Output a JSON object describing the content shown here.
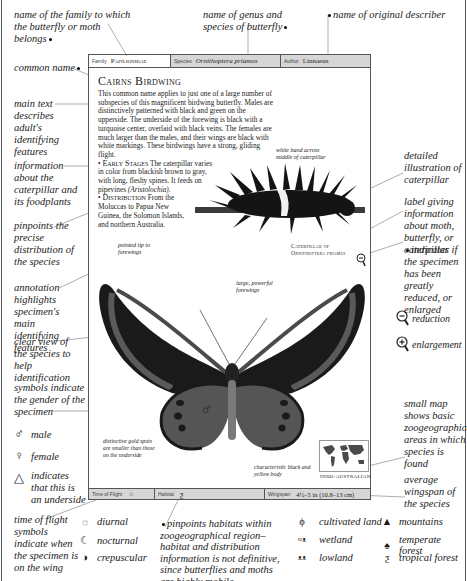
{
  "header": {
    "family_label": "Family",
    "family_value": "Papilionidae",
    "species_label": "Species",
    "species_value": "Ornithoptera priamus",
    "author_label": "Author",
    "author_value": "Linnaeus"
  },
  "main": {
    "title": "Cairns Birdwing",
    "body": "This common name applies to just one of a large number of subspecies of this magnificent birdwing butterfly. Males are distinctively patterned with black and green on the upperside. The underside of the forewing is black with a turquoise center, overlaid with black veins. The females are much larger than the males, and their wings are black with white markings. These birdwings have a strong, gliding flight.",
    "early_stages_label": "Early Stages",
    "early_stages_text": "The caterpillar varies in color from blackish brown to gray, with long, fleshy spines. It feeds on pipevines",
    "early_stages_plant": "(Aristolochia).",
    "distribution_label": "Distribution",
    "distribution_text": "From the Moluccas to Papua New Guinea, the Solomon Islands, and northern Australia.",
    "caterpillar_caption_line1": "Caterpillar of",
    "caterpillar_caption_line2": "Ornithoptera priamus",
    "gender_symbol": "♂",
    "map_label": "Indo-Australian"
  },
  "inner_annotations": {
    "white_band": "white band across middle of caterpillar",
    "pointed_tip": "pointed tip to forewings",
    "large_forewings": "large, powerful forewings",
    "gold_spots": "distinctive gold spots are smaller than those on the underside",
    "black_yellow_body": "characteristic black and yellow body"
  },
  "footer": {
    "time_label": "Time of Flight",
    "time_icon": "sun-icon",
    "habitat_label": "Habitat",
    "habitat_icon": "tropical-forest-icon",
    "wingspan_label": "Wingspan",
    "wingspan_value": "4½–5 in (10.8–13 cm)"
  },
  "top_annotations": {
    "family": "name of the family to which the butterfly or moth belongs",
    "genus_species": "name of genus and species of butterfly",
    "describer": "name of original describer"
  },
  "left_annotations": {
    "common_name": "common name",
    "main_text": "main text describes adult's identifying features",
    "caterpillar_info": "information about the caterpillar and its foodplants",
    "distribution": "pinpoints the precise distribution of the species",
    "annotation": "annotation highlights specimen's main identifying features",
    "clear_view": "clear view of the species to help identification",
    "gender": "symbols indicate the gender of the specimen"
  },
  "right_annotations": {
    "detailed_illustration": "detailed illustration of caterpillar",
    "label_info": "label giving information about moth, butterfly, or caterpillar",
    "scale_indicator": "indicates if the specimen has been greatly reduced, or enlarged",
    "reduction": "reduction",
    "enlargement": "enlargement",
    "small_map": "small map shows basic zoogeographical areas in which species is found",
    "wingspan": "average wingspan of the species"
  },
  "symbol_legend": {
    "male": "male",
    "female": "female",
    "underside": "indicates that this is an underside"
  },
  "bottom_annotations": {
    "time_of_flight": "time of flight symbols indicate when the specimen is on the wing",
    "habitat": "pinpoints habitats within zoogeographical region–habitat and distribution information is not definitive, since butterflies and moths are highly mobile"
  },
  "flight_legend": [
    {
      "icon": "sun-icon",
      "label": "diurnal"
    },
    {
      "icon": "moon-icon",
      "label": "nocturnal"
    },
    {
      "icon": "half-circle-icon",
      "label": "crepuscular"
    }
  ],
  "habitat_legend": [
    {
      "icon": "cultivated-land-icon",
      "label": "cultivated land"
    },
    {
      "icon": "wetland-icon",
      "label": "wetland"
    },
    {
      "icon": "lowland-icon",
      "label": "lowland"
    },
    {
      "icon": "mountains-icon",
      "label": "mountains"
    },
    {
      "icon": "temperate-forest-icon",
      "label": "temperate forest"
    },
    {
      "icon": "tropical-forest-icon",
      "label": "tropical forest"
    }
  ]
}
